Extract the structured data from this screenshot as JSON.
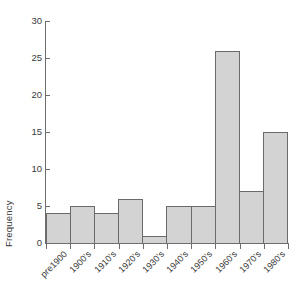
{
  "chart_data": {
    "type": "bar",
    "title": "",
    "subtitle": "",
    "xlabel": "",
    "ylabel": "Frequency",
    "categories": [
      "pre1900",
      "1900's",
      "1910's",
      "1920's",
      "1930's",
      "1940's",
      "1950's",
      "1960's",
      "1970's",
      "1980's"
    ],
    "values": [
      4,
      5,
      4,
      6,
      1,
      5,
      5,
      26,
      7,
      15
    ],
    "ylim": [
      0,
      30
    ],
    "ytick_labels": [
      "0",
      "5",
      "10",
      "15",
      "20",
      "25",
      "30"
    ],
    "ytick_values": [
      0,
      5,
      10,
      15,
      20,
      25,
      30
    ],
    "grid": false,
    "legend": "none",
    "bar_style": "contiguous-histogram",
    "colors": {
      "bar_fill": "#d3d3d3",
      "bar_border": "#6a6a6a",
      "axis": "#6e6e6e",
      "text": "#3a3a3a",
      "background": "#ffffff"
    }
  }
}
